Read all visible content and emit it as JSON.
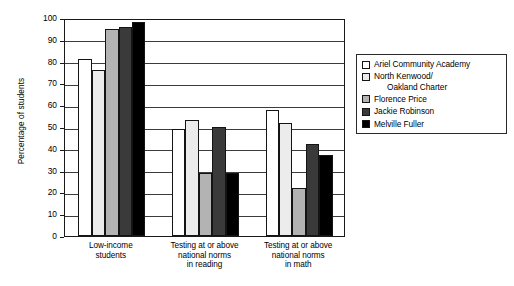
{
  "chart_data": {
    "type": "bar",
    "title": "",
    "subtitle": "",
    "xlabel": "",
    "ylabel": "Percentage of students",
    "ylim": [
      0,
      100
    ],
    "ytick_step": 10,
    "yticks": [
      0,
      10,
      20,
      30,
      40,
      50,
      60,
      70,
      80,
      90,
      100
    ],
    "ytick_labels": [
      "0",
      "10",
      "20",
      "30",
      "40",
      "50",
      "60",
      "70",
      "80",
      "90",
      "100"
    ],
    "grid": "horizontal",
    "legend_position": "right",
    "categories": [
      "Low-income\nstudents",
      "Testing at or above\nnational norms\nin reading",
      "Testing at or above\nnational norms\nin math"
    ],
    "series": [
      {
        "name": "Ariel Community Academy",
        "name_lines": "Ariel Community Academy",
        "color": "#ffffff",
        "values": [
          81,
          49,
          58
        ]
      },
      {
        "name": "North Kenwood/ Oakland Charter",
        "name_lines": "North Kenwood/",
        "name_line2": "Oakland Charter",
        "color": "#ececec",
        "values": [
          76,
          53,
          52
        ]
      },
      {
        "name": "Florence Price",
        "name_lines": "Florence Price",
        "color": "#b3b3b3",
        "values": [
          95,
          29,
          22
        ]
      },
      {
        "name": "Jackie Robinson",
        "name_lines": "Jackie Robinson",
        "color": "#3a3a3a",
        "values": [
          96,
          50,
          42
        ]
      },
      {
        "name": "Melville Fuller",
        "name_lines": "Melville Fuller",
        "color": "#000000",
        "values": [
          98,
          29,
          37
        ]
      }
    ]
  }
}
